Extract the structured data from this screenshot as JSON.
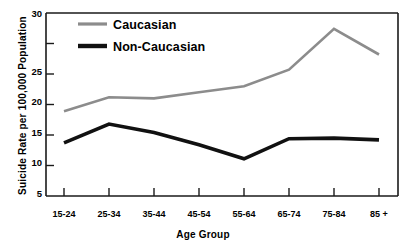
{
  "chart_data": {
    "type": "line",
    "title": "",
    "xlabel": "Age Group",
    "ylabel": "Suicide Rate per 100,000 Population",
    "categories": [
      "15-24",
      "25-34",
      "35-44",
      "45-54",
      "55-64",
      "65-74",
      "75-84",
      "85 +"
    ],
    "xtick_labels": [
      "15-24",
      "25-34",
      "35-44",
      "45-54",
      "55-64",
      "65-74",
      "75-84",
      "85 +"
    ],
    "ytick_labels": [
      "5",
      "10",
      "15",
      "20",
      "25",
      "30"
    ],
    "ytick_values": [
      5,
      10,
      15,
      20,
      25,
      30
    ],
    "ylim": [
      0,
      30
    ],
    "grid": false,
    "legend_position": "upper-left-inside",
    "series": [
      {
        "name": "Caucasian",
        "color": "#8c8c8c",
        "values": [
          13.9,
          16.2,
          16.0,
          17.0,
          18.0,
          20.7,
          27.4,
          23.2
        ]
      },
      {
        "name": "Non-Caucasian",
        "color": "#111111",
        "values": [
          8.7,
          11.8,
          10.4,
          8.4,
          6.1,
          9.4,
          9.5,
          9.2
        ]
      }
    ]
  },
  "legend": {
    "entries": [
      {
        "label": "Caucasian",
        "swatch": "line-swatch-gray"
      },
      {
        "label": "Non-Caucasian",
        "swatch": "line-swatch-black"
      }
    ]
  },
  "axes": {
    "y_title": "Suicide Rate per 100,000 Population",
    "x_title": "Age Group"
  }
}
